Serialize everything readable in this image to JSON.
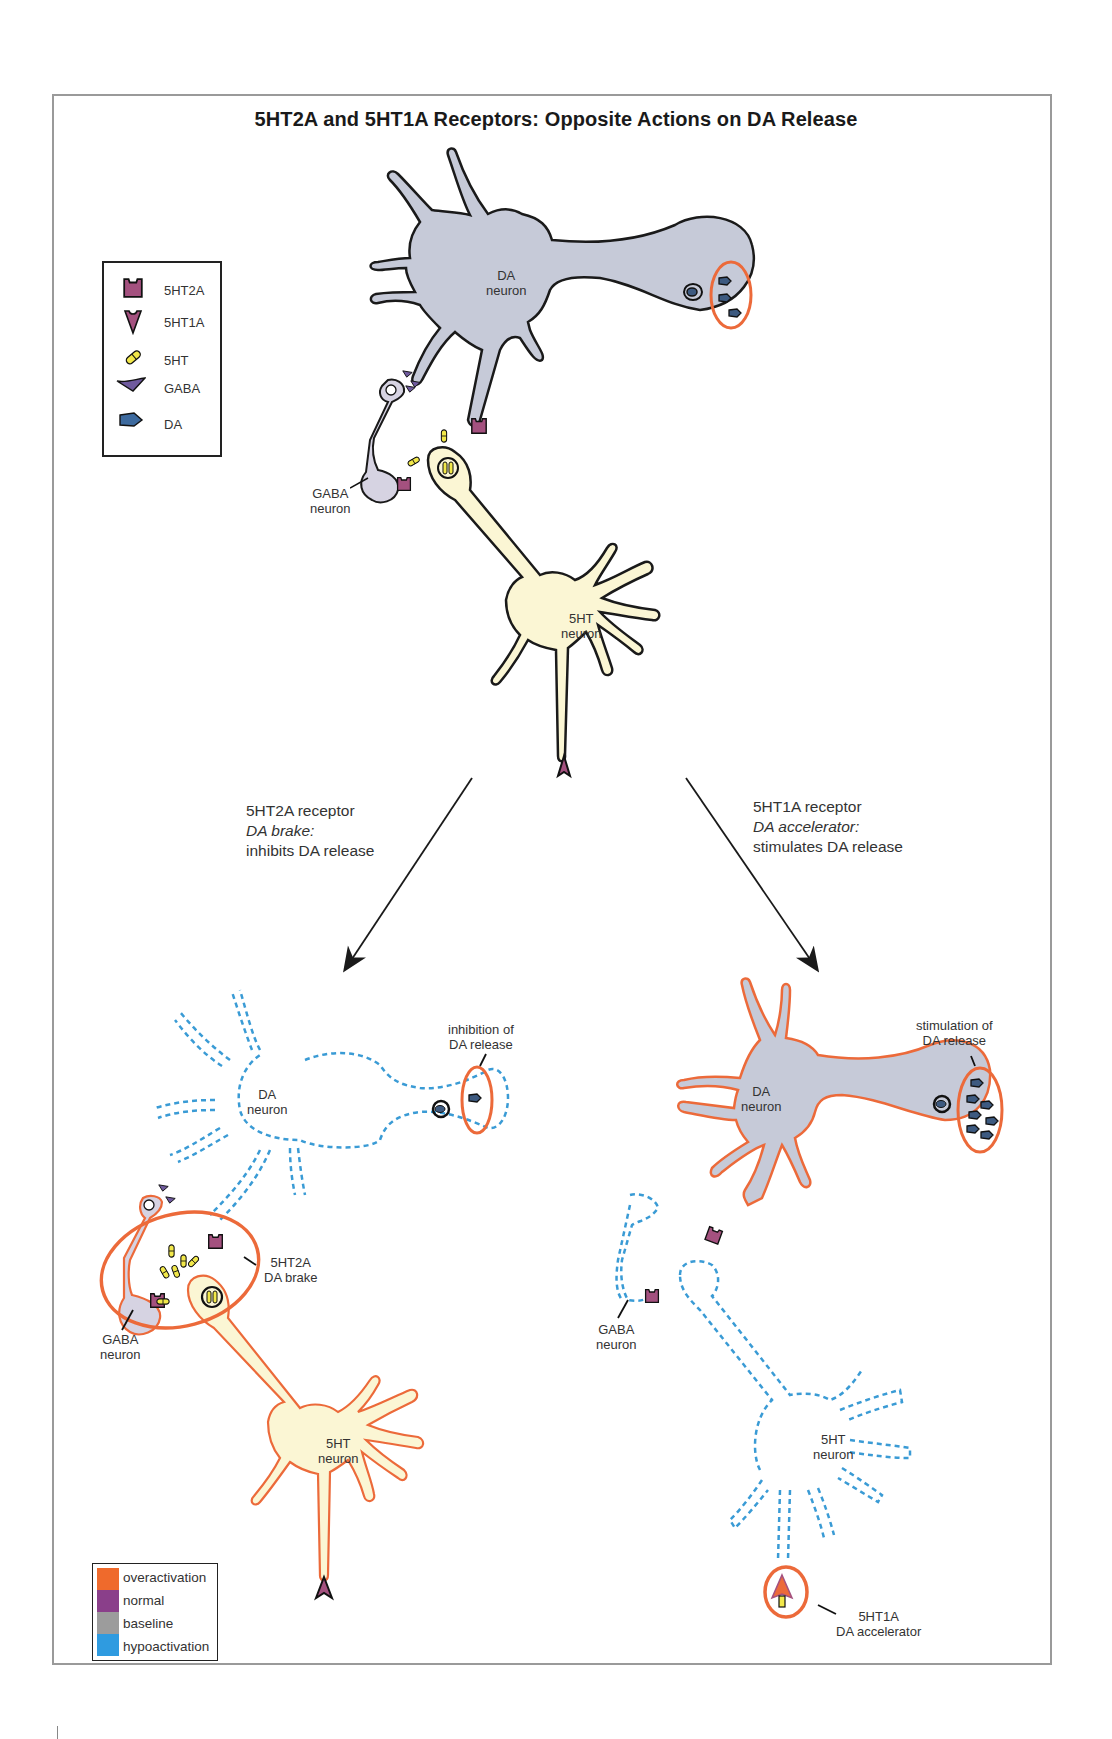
{
  "title": "5HT2A and 5HT1A Receptors: Opposite Actions on DA Release",
  "symbol_legend": {
    "items": [
      {
        "icon": "5ht2a-receptor-icon",
        "label": "5HT2A",
        "color": "#a4517f"
      },
      {
        "icon": "5ht1a-receptor-icon",
        "label": "5HT1A",
        "color": "#a4517f"
      },
      {
        "icon": "5ht-molecule-icon",
        "label": "5HT",
        "color": "#f2e84a"
      },
      {
        "icon": "gaba-molecule-icon",
        "label": "GABA",
        "color": "#6f5a9e"
      },
      {
        "icon": "da-molecule-icon",
        "label": "DA",
        "color": "#3d6a9e"
      }
    ]
  },
  "top_panel": {
    "da_neuron_label": [
      "DA",
      "neuron"
    ],
    "gaba_neuron_label": [
      "GABA",
      "neuron"
    ],
    "serotonin_neuron_label": [
      "5HT",
      "neuron"
    ]
  },
  "arrows": {
    "left": {
      "line1": "5HT2A receptor",
      "line2": "DA brake:",
      "line3": "inhibits DA release"
    },
    "right": {
      "line1": "5HT1A receptor",
      "line2": "DA accelerator:",
      "line3": "stimulates DA release"
    }
  },
  "bottom_left_panel": {
    "da_neuron_label": [
      "DA",
      "neuron"
    ],
    "release_annotation": [
      "inhibition of",
      "DA release"
    ],
    "brake_annotation": [
      "5HT2A",
      "DA brake"
    ],
    "gaba_neuron_label": [
      "GABA",
      "neuron"
    ],
    "serotonin_neuron_label": [
      "5HT",
      "neuron"
    ]
  },
  "bottom_right_panel": {
    "da_neuron_label": [
      "DA",
      "neuron"
    ],
    "release_annotation": [
      "stimulation of",
      "DA release"
    ],
    "gaba_neuron_label": [
      "GABA",
      "neuron"
    ],
    "serotonin_neuron_label": [
      "5HT",
      "neuron"
    ],
    "accelerator_annotation": [
      "5HT1A",
      "DA accelerator"
    ]
  },
  "activity_legend": {
    "items": [
      {
        "label": "overactivation",
        "color": "#ef6a2c"
      },
      {
        "label": "normal",
        "color": "#8a3f8a"
      },
      {
        "label": "baseline",
        "color": "#9c9c9c"
      },
      {
        "label": "hypoactivation",
        "color": "#2f9be0"
      }
    ]
  },
  "colors": {
    "da_neuron_fill": "#c6cad8",
    "serotonin_neuron_fill": "#fbf6d4",
    "gaba_neuron_fill": "#d6d3e2",
    "outline_normal": "#1a1a1a",
    "outline_over": "#ec6a3a",
    "outline_hypo": "#3a9bd5",
    "highlight_ellipse": "#ec6a3a",
    "receptor": "#a4517f",
    "da_vesicle": "#3d5a80",
    "serotonin_molecule": "#f2e84a"
  }
}
